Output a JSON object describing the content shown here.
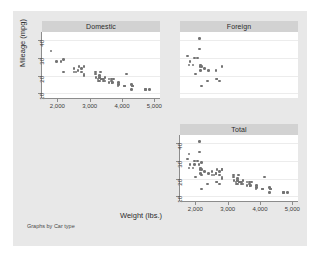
{
  "figure": {
    "note": "Graphs by Car type",
    "xlabel": "Weight (lbs.)",
    "ylabel": "Mileage (mpg)",
    "point_color": "#737373",
    "title_band_color": "#d2d2d2",
    "graph_region_color": "#e8e8e8",
    "background_color": "#ffffff"
  },
  "axes": {
    "x_ticks": [
      "2,000",
      "3,000",
      "4,000",
      "5,000"
    ],
    "x_tick_values": [
      2000,
      3000,
      4000,
      5000
    ],
    "y_ticks": [
      "10",
      "20",
      "30",
      "40"
    ],
    "y_tick_values": [
      10,
      20,
      30,
      40
    ],
    "xlim": [
      1650,
      5050
    ],
    "ylim": [
      9,
      43
    ]
  },
  "panels": [
    {
      "key": "domestic",
      "label": "Domestic",
      "show_y_axis": true,
      "show_x_axis": true
    },
    {
      "key": "foreign",
      "label": "Foreign",
      "show_y_axis": false,
      "show_x_axis": false
    },
    {
      "key": "total",
      "label": "Total",
      "show_y_axis": true,
      "show_x_axis": true
    }
  ],
  "chart_data": {
    "type": "scatter",
    "title": "",
    "xlabel": "Weight (lbs.)",
    "ylabel": "Mileage (mpg)",
    "xlim": [
      1650,
      5050
    ],
    "ylim": [
      9,
      43
    ],
    "grid": true,
    "legend": "none",
    "note": "Graphs by Car type",
    "facets": [
      "Domestic",
      "Foreign",
      "Total"
    ],
    "series": [
      {
        "name": "Domestic",
        "n": 52,
        "x": [
          4720,
          3690,
          3180,
          4080,
          3670,
          3310,
          2750,
          3280,
          3880,
          4330,
          3900,
          4290,
          4330,
          3900,
          4290,
          2110,
          3690,
          3180,
          4080,
          3670,
          3310,
          2750,
          4840,
          4720,
          3430,
          3260,
          3600,
          3600,
          3740,
          3470,
          2830,
          2200,
          2520,
          3330,
          2640,
          2830,
          2520,
          4130,
          2830,
          3370,
          3370,
          3310,
          2200,
          2670,
          1800,
          1980,
          2580,
          3700,
          3370,
          3420,
          3470,
          3190
        ],
        "y": [
          12,
          16,
          22,
          14,
          17,
          20,
          22,
          17,
          14,
          14,
          15,
          15,
          14,
          16,
          12,
          28,
          16,
          21,
          14,
          18,
          19,
          24,
          12,
          12,
          18,
          18,
          16,
          18,
          18,
          19,
          21,
          22,
          22,
          22,
          23,
          20,
          24,
          21,
          25,
          18,
          18,
          17,
          29,
          25,
          34,
          28,
          22,
          16,
          18,
          17,
          17,
          19
        ]
      },
      {
        "name": "Foreign",
        "n": 22,
        "x": [
          2640,
          2830,
          2070,
          2280,
          2130,
          2650,
          1760,
          2410,
          2120,
          1800,
          2200,
          2150,
          1930,
          2670,
          2160,
          1980,
          2750,
          1830,
          2010,
          2200,
          2370,
          2160
        ],
        "y": [
          23,
          25,
          30,
          24,
          35,
          18,
          31,
          23,
          41,
          26,
          25,
          25,
          26,
          18,
          26,
          30,
          17,
          28,
          21,
          14,
          17,
          23
        ]
      },
      {
        "name": "Total",
        "n": 74,
        "x": [
          4720,
          3690,
          3180,
          4080,
          3670,
          3310,
          2750,
          3280,
          3880,
          4330,
          3900,
          4290,
          4330,
          3900,
          4290,
          2110,
          3690,
          3180,
          4080,
          3670,
          3310,
          2750,
          4840,
          4720,
          3430,
          3260,
          3600,
          3600,
          3740,
          3470,
          2830,
          2200,
          2520,
          3330,
          2640,
          2830,
          2520,
          4130,
          2830,
          3370,
          3370,
          3310,
          2200,
          2670,
          1800,
          1980,
          2580,
          3700,
          3370,
          3420,
          3470,
          3190,
          2640,
          2830,
          2070,
          2280,
          2130,
          2650,
          1760,
          2410,
          2120,
          1800,
          2200,
          2150,
          1930,
          2670,
          2160,
          1980,
          2750,
          1830,
          2010,
          2200,
          2370,
          2160
        ],
        "y": [
          12,
          16,
          22,
          14,
          17,
          20,
          22,
          17,
          14,
          14,
          15,
          15,
          14,
          16,
          12,
          28,
          16,
          21,
          14,
          18,
          19,
          24,
          12,
          12,
          18,
          18,
          16,
          18,
          18,
          19,
          21,
          22,
          22,
          22,
          23,
          20,
          24,
          21,
          25,
          18,
          18,
          17,
          29,
          25,
          34,
          28,
          22,
          16,
          18,
          17,
          17,
          19,
          23,
          25,
          30,
          24,
          35,
          18,
          31,
          23,
          41,
          26,
          25,
          25,
          26,
          18,
          26,
          30,
          17,
          28,
          21,
          14,
          17,
          23
        ]
      }
    ]
  }
}
